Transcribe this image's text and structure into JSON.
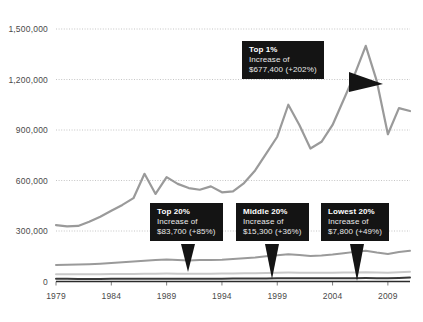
{
  "chart_data": {
    "type": "line",
    "title": "",
    "xlabel": "",
    "ylabel": "",
    "xlim": [
      1979,
      2011
    ],
    "ylim": [
      0,
      1500000
    ],
    "grid": true,
    "legend_position": "none",
    "ytick_labels": [
      "1,500,000",
      "1,200,000",
      "900,000",
      "600,000",
      "300,000",
      "0"
    ],
    "ytick_values": [
      1500000,
      1200000,
      900000,
      600000,
      300000,
      0
    ],
    "xtick_labels": [
      "1979",
      "1984",
      "1989",
      "1994",
      "1999",
      "2004",
      "2009"
    ],
    "xtick_values": [
      1979,
      1984,
      1989,
      1994,
      1999,
      2004,
      2009
    ],
    "x": [
      1979,
      1980,
      1981,
      1982,
      1983,
      1984,
      1985,
      1986,
      1987,
      1988,
      1989,
      1990,
      1991,
      1992,
      1993,
      1994,
      1995,
      1996,
      1997,
      1998,
      1999,
      2000,
      2001,
      2002,
      2003,
      2004,
      2005,
      2006,
      2007,
      2008,
      2009,
      2010,
      2011
    ],
    "series": [
      {
        "name": "Top 1%",
        "color": "#9a9a9a",
        "values": [
          335000,
          327000,
          330000,
          355000,
          385000,
          420000,
          455000,
          495000,
          640000,
          520000,
          620000,
          580000,
          555000,
          545000,
          565000,
          530000,
          535000,
          585000,
          660000,
          760000,
          860000,
          1050000,
          930000,
          790000,
          830000,
          930000,
          1080000,
          1230000,
          1400000,
          1190000,
          875000,
          1030000,
          1012800
        ]
      },
      {
        "name": "Top 20%",
        "color": "#9a9a9a",
        "values": [
          98500,
          99000,
          100500,
          103000,
          106000,
          110000,
          114000,
          118500,
          124000,
          127000,
          130000,
          128000,
          125000,
          128000,
          127000,
          129000,
          133000,
          138000,
          143000,
          150000,
          156000,
          162000,
          158000,
          152000,
          155000,
          160000,
          168000,
          176000,
          182500,
          172000,
          163000,
          175000,
          182200
        ]
      },
      {
        "name": "Middle 20%",
        "color": "#c9c9c9",
        "values": [
          42500,
          42700,
          42600,
          42900,
          43200,
          44000,
          44500,
          45200,
          45800,
          46200,
          47000,
          46500,
          46000,
          46400,
          46700,
          47200,
          47900,
          48600,
          49600,
          50800,
          52000,
          52800,
          52200,
          51400,
          51500,
          52200,
          53000,
          54000,
          54800,
          53200,
          51500,
          54500,
          57800
        ]
      },
      {
        "name": "Lowest 20%",
        "color": "#3a3a3a",
        "values": [
          15900,
          15800,
          15500,
          15300,
          15400,
          15700,
          15900,
          16200,
          16500,
          16700,
          17000,
          16800,
          16500,
          16600,
          16700,
          17000,
          17300,
          17600,
          18000,
          18500,
          18900,
          19200,
          19000,
          18700,
          18800,
          19100,
          19400,
          19800,
          20100,
          19600,
          19100,
          20800,
          23700
        ]
      }
    ],
    "annotations": [
      {
        "id": "top-1-percent",
        "title": "Top 1%",
        "line1": "Increase of",
        "line2": "$677,400 (+202%)",
        "series": "Top 1%",
        "pointer": "right"
      },
      {
        "id": "top-20-percent",
        "title": "Top 20%",
        "line1": "Increase of",
        "line2": "$83,700 (+85%)",
        "series": "Top 20%",
        "pointer": "down"
      },
      {
        "id": "middle-20-percent",
        "title": "Middle 20%",
        "line1": "Increase of",
        "line2": "$15,300 (+36%)",
        "series": "Middle 20%",
        "pointer": "down"
      },
      {
        "id": "lowest-20-percent",
        "title": "Lowest 20%",
        "line1": "Increase of",
        "line2": "$7,800 (+49%)",
        "series": "Lowest 20%",
        "pointer": "down"
      }
    ],
    "colors": {
      "background": "#ffffff",
      "gridline": "#b6b6b6",
      "axis": "#2b2b2b",
      "tick_text": "#4a4a4a",
      "callout_bg": "#141414",
      "callout_text": "#ffffff"
    }
  }
}
